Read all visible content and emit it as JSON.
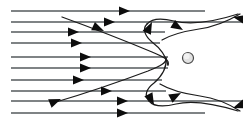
{
  "figure": {
    "caption": "",
    "width": 243,
    "height": 123,
    "background_color": "#ffffff",
    "streamline_color": "#555a5d",
    "vortex_color": "#1c1c1c",
    "arrow_color": "#0d0d0d",
    "obstacle_color": "#e2e2e2",
    "obstacle_outline_color": "#4a4a4a"
  },
  "chart_data": {
    "type": "line",
    "xlabel": "",
    "ylabel": "",
    "xlim": [
      0,
      243
    ],
    "ylim": [
      0,
      123
    ],
    "grid": false,
    "legend": "none",
    "series": [
      {
        "name": "streamline-1",
        "x": [
          11,
          205
        ],
        "y": [
          11,
          11
        ]
      },
      {
        "name": "streamline-2",
        "x": [
          11,
          243
        ],
        "y": [
          22,
          22
        ]
      },
      {
        "name": "streamline-3",
        "x": [
          11,
          165
        ],
        "y": [
          32,
          32
        ]
      },
      {
        "name": "streamline-4",
        "x": [
          11,
          160
        ],
        "y": [
          43,
          43
        ]
      },
      {
        "name": "streamline-5",
        "x": [
          11,
          168
        ],
        "y": [
          57,
          57
        ]
      },
      {
        "name": "streamline-6",
        "x": [
          11,
          168
        ],
        "y": [
          68,
          68
        ]
      },
      {
        "name": "streamline-7",
        "x": [
          11,
          162
        ],
        "y": [
          80,
          80
        ]
      },
      {
        "name": "streamline-8",
        "x": [
          11,
          166
        ],
        "y": [
          91,
          91
        ]
      },
      {
        "name": "streamline-9",
        "x": [
          11,
          243
        ],
        "y": [
          101,
          101
        ]
      },
      {
        "name": "streamline-10",
        "x": [
          11,
          205
        ],
        "y": [
          113,
          113
        ]
      }
    ],
    "obstacle": {
      "cx": 188,
      "cy": 58,
      "r": 5.5,
      "shape": "circle"
    },
    "arrow_markers": [
      {
        "name": "arrow-top-1",
        "x": 130,
        "y": 11,
        "angle": 0
      },
      {
        "name": "arrow-row2",
        "x": 115,
        "y": 22,
        "angle": 0
      },
      {
        "name": "arrow-row3",
        "x": 79,
        "y": 32,
        "angle": 0
      },
      {
        "name": "arrow-row4",
        "x": 82,
        "y": 43,
        "angle": 0
      },
      {
        "name": "arrow-row5",
        "x": 91,
        "y": 57,
        "angle": 0
      },
      {
        "name": "arrow-row6",
        "x": 91,
        "y": 68,
        "angle": 0
      },
      {
        "name": "arrow-row7",
        "x": 84,
        "y": 80,
        "angle": 0
      },
      {
        "name": "arrow-row8",
        "x": 112,
        "y": 91,
        "angle": 0
      },
      {
        "name": "arrow-row9",
        "x": 128,
        "y": 101,
        "angle": 0
      },
      {
        "name": "arrow-bottom-1",
        "x": 128,
        "y": 113,
        "angle": 0
      },
      {
        "name": "arrow-diag-upper",
        "x": 104,
        "y": 31,
        "angle": 24
      },
      {
        "name": "arrow-vortex-upper-up",
        "x": 152,
        "y": 22,
        "angle": -64
      },
      {
        "name": "arrow-vortex-upper-re",
        "x": 183,
        "y": 30,
        "angle": 31
      },
      {
        "name": "arrow-top-right-in",
        "x": 233,
        "y": 17,
        "angle": 192
      },
      {
        "name": "arrow-diag-lower",
        "x": 61,
        "y": 99,
        "angle": -22
      },
      {
        "name": "arrow-vortex-lower-dn",
        "x": 154,
        "y": 105,
        "angle": 62
      },
      {
        "name": "arrow-vortex-lower-re",
        "x": 181,
        "y": 93,
        "angle": -28
      },
      {
        "name": "arrow-bottom-right-in",
        "x": 233,
        "y": 108,
        "angle": 160
      }
    ],
    "annotations": []
  },
  "elements": {
    "upper_vortex_label": "upper recirculation vortex",
    "lower_vortex_label": "lower recirculation vortex",
    "obstacle_label": "circular obstacle",
    "inflow_label": "uniform inflow streamlines"
  }
}
